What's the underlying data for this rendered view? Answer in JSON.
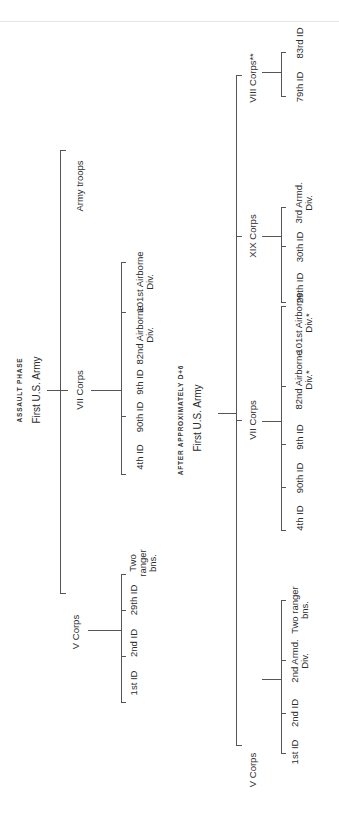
{
  "colors": {
    "line": "#555555",
    "text": "#2b2b2b",
    "background": "#ffffff"
  },
  "assault_phase": {
    "title": "ASSAULT PHASE",
    "army": "First U.S. Army",
    "army_troops": "Army troops",
    "corps": [
      {
        "name": "V Corps",
        "units": [
          "1st ID",
          "2nd ID",
          "29th ID",
          "Two ranger bns."
        ]
      },
      {
        "name": "VII Corps",
        "units": [
          "4th ID",
          "90th ID",
          "9th ID",
          "82nd Airborne Div.",
          "101st Airborne Div."
        ]
      }
    ],
    "labels": {
      "v_corps": "V Corps",
      "v_1": "1st ID",
      "v_2": "2nd ID",
      "v_3": "29th ID",
      "v_4a": "Two",
      "v_4b": "ranger",
      "v_4c": "bns.",
      "vii_corps": "VII Corps",
      "vii_1": "4th ID",
      "vii_2": "90th ID",
      "vii_3": "9th ID",
      "vii_4a": "82nd Airborne",
      "vii_4b": "Div.",
      "vii_5a": "101st Airborne",
      "vii_5b": "Div."
    }
  },
  "after_d6": {
    "title": "AFTER APPROXIMATELY D+6",
    "army": "First U.S. Army",
    "corps": [
      {
        "name": "V Corps",
        "units": [
          "1st ID",
          "2nd ID",
          "2nd Armd. Div.",
          "Two ranger bns."
        ]
      },
      {
        "name": "VII Corps",
        "units": [
          "4th ID",
          "90th ID",
          "9th ID",
          "82nd Airborne Div.*",
          "101st Airborne Div.*"
        ]
      },
      {
        "name": "XIX Corps",
        "units": [
          "29th ID",
          "30th ID",
          "3rd Armd. Div."
        ]
      },
      {
        "name": "VIII Corps**",
        "units": [
          "79th ID",
          "83rd ID"
        ]
      }
    ],
    "labels": {
      "v_corps": "V Corps",
      "v_1": "1st ID",
      "v_2": "2nd ID",
      "v_3a": "2nd Armd.",
      "v_3b": "Div.",
      "v_4a": "Two ranger",
      "v_4b": "bns.",
      "vii_corps": "VII Corps",
      "vii_1": "4th ID",
      "vii_2": "90th ID",
      "vii_3": "9th ID",
      "vii_4a": "82nd Airborne",
      "vii_4b": "Div.*",
      "vii_5a": "101st Airborne",
      "vii_5b": "Div.*",
      "xix_corps": "XIX Corps",
      "xix_1": "29th ID",
      "xix_2": "30th ID",
      "xix_3a": "3rd Armd.",
      "xix_3b": "Div.",
      "viii_corps": "VIII Corps**",
      "viii_1": "79th ID",
      "viii_2": "83rd ID"
    }
  }
}
